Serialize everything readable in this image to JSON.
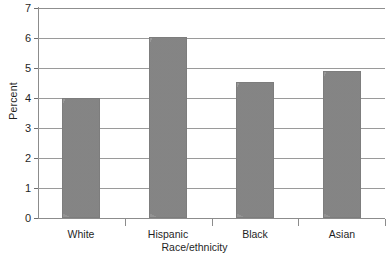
{
  "chart_data": {
    "type": "bar",
    "title": "",
    "categories": [
      "White",
      "Hispanic",
      "Black",
      "Asian"
    ],
    "values": [
      4.0,
      6.05,
      4.55,
      4.9
    ],
    "xlabel": "Race/ethnicity",
    "ylabel": "Percent",
    "ylim": [
      0,
      7
    ],
    "ytick_labels": [
      "0",
      "1",
      "2",
      "3",
      "4",
      "5",
      "6",
      "7"
    ],
    "ytick_values": [
      0,
      1,
      2,
      3,
      4,
      5,
      6,
      7
    ],
    "grid": "horizontal",
    "legend": "none",
    "bar_color": "#949494",
    "bar_edge_color": "#7d7d7d",
    "gridline_color": "#9a9a9a",
    "axis_color": "#8c8c8c",
    "background": "#ffffff"
  }
}
